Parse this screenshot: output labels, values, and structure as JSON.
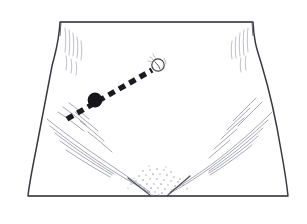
{
  "figure": {
    "title": "Lower abdomen and pelvis line drawing with marked incision path",
    "canvas": {
      "width": 307,
      "height": 224,
      "background": "#ffffff"
    },
    "style": {
      "outline_color": "#3a3a42",
      "outline_width": 1.6,
      "hatch_color": "#8f909c",
      "hatch_width": 0.6,
      "marker_color": "#1b1b20",
      "stipple_color": "#9a9aa6"
    },
    "torso": {
      "name": "lower-torso-outline",
      "description": "Frontal view of the lower abdomen, waist and hips cropped by a straight top edge and a straight bottom edge",
      "top_edge_y": 22,
      "bottom_edge_y": 196,
      "top_left_x": 60,
      "top_right_x": 253,
      "bottom_left_x": 28,
      "bottom_right_x": 288,
      "waist_left_x": 52,
      "waist_right_x": 258,
      "path": "M 60 22 L 253 22 C 254 44 258 52 262 66 C 268 86 276 120 281 150 C 285 172 287 186 288 196 L 28 196 C 29 186 32 170 36 150 C 42 118 48 86 52 66 C 56 50 59 42 60 22 Z"
    },
    "markings": {
      "navel": {
        "name": "navel-umbilicus",
        "cx": 158,
        "cy": 65,
        "r": 6.2,
        "label": "umbilicus"
      },
      "incision_path": {
        "name": "dashed-incision-line",
        "label": "dashed guide line",
        "x1": 67,
        "y1": 119,
        "x2": 152,
        "y2": 70,
        "dash_length": 7,
        "dash_gap": 5,
        "stroke_width": 5.5
      },
      "entry_point": {
        "name": "entry-point-marker",
        "cx": 95,
        "cy": 100,
        "r": 7.4,
        "label": "insertion point"
      }
    },
    "shading_regions": [
      {
        "name": "left-waist-hatching",
        "location": "upper left flank below waist notch"
      },
      {
        "name": "right-waist-hatching",
        "location": "upper right flank below waist notch"
      },
      {
        "name": "left-inguinal-crease",
        "location": "left groin fold sweeping to centre"
      },
      {
        "name": "right-inguinal-crease",
        "location": "right groin fold sweeping to centre"
      },
      {
        "name": "pubic-stipple",
        "location": "central lower pubic triangle"
      }
    ]
  }
}
